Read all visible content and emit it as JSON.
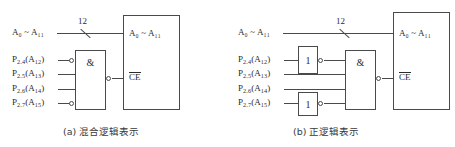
{
  "figure": {
    "panels": [
      {
        "id": "a",
        "caption": "(a) 混合逻辑表示",
        "bus": {
          "label": "A₀ ~ A₁₁",
          "label_main": "A",
          "width_label": "12"
        },
        "inputs": [
          {
            "port": "P",
            "port_sub": "2.4",
            "addr": "A",
            "addr_sub": "12",
            "text": "P2.4 (A12)",
            "inverted": true
          },
          {
            "port": "P",
            "port_sub": "2.5",
            "addr": "A",
            "addr_sub": "13",
            "text": "P2.5 (A13)",
            "inverted": false
          },
          {
            "port": "P",
            "port_sub": "2.6",
            "addr": "A",
            "addr_sub": "14",
            "text": "P2.6 (A14)",
            "inverted": false
          },
          {
            "port": "P",
            "port_sub": "2.7",
            "addr": "A",
            "addr_sub": "15",
            "text": "P2.7 (A15)",
            "inverted": true
          }
        ],
        "gate": {
          "symbol": "&",
          "output_inverted": true
        },
        "inverters": [],
        "chip": {
          "addr_label": "A₀ ~ A₁₁",
          "enable_label": "CE",
          "enable_active_low": true
        }
      },
      {
        "id": "b",
        "caption": "(b) 正逻辑表示",
        "bus": {
          "label": "A₀ ~ A₁₁",
          "label_main": "A",
          "width_label": "12"
        },
        "inputs": [
          {
            "port": "P",
            "port_sub": "2.4",
            "addr": "A",
            "addr_sub": "12",
            "text": "P2.4 (A12)",
            "inverted": true
          },
          {
            "port": "P",
            "port_sub": "2.5",
            "addr": "A",
            "addr_sub": "13",
            "text": "P2.5 (A13)",
            "inverted": false
          },
          {
            "port": "P",
            "port_sub": "2.6",
            "addr": "A",
            "addr_sub": "14",
            "text": "P2.6 (A14)",
            "inverted": false
          },
          {
            "port": "P",
            "port_sub": "2.7",
            "addr": "A",
            "addr_sub": "15",
            "text": "P2.7 (A15)",
            "inverted": true
          }
        ],
        "gate": {
          "symbol": "&",
          "output_inverted": true
        },
        "inverters": [
          {
            "symbol": "1",
            "row": 1,
            "output_inverted": true
          },
          {
            "symbol": "1",
            "row": 4,
            "output_inverted": true
          }
        ],
        "chip": {
          "addr_label": "A₀ ~ A₁₁",
          "enable_label": "CE",
          "enable_active_low": true
        }
      }
    ],
    "colors": {
      "line": "#4a4a4a",
      "text": "#2b2b2b",
      "background": "#ffffff"
    }
  }
}
